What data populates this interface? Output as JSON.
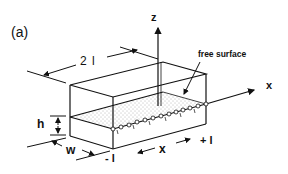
{
  "figure": {
    "panel_label": "(a)",
    "axes": {
      "z_label": "z",
      "x_label": "x"
    },
    "annotations": {
      "free_surface": "free surface",
      "length": "2 l",
      "height": "h",
      "width": "w",
      "x_dim": "x",
      "minus_l": "- l",
      "plus_l": "+ l"
    },
    "colors": {
      "line": "#111111",
      "background": "#ffffff",
      "stipple": "#666666"
    }
  }
}
